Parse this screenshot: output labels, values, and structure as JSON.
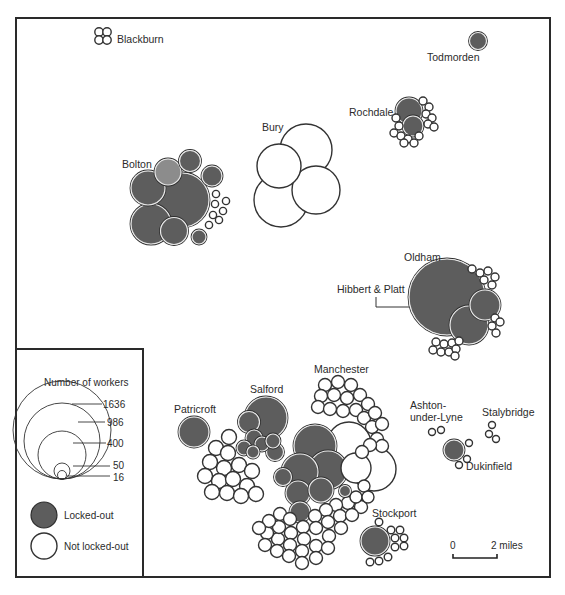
{
  "colors": {
    "locked_out": "#5d5d5d",
    "locked_out_light": "#8c8c8c",
    "not_locked_out": "#ffffff",
    "stroke": "#333333",
    "frame": "#2a2a2a"
  },
  "places": [
    {
      "name": "Blackburn",
      "label": "Blackburn",
      "x": 117,
      "y": 43
    },
    {
      "name": "Todmorden",
      "label": "Todmorden",
      "x": 427,
      "y": 61
    },
    {
      "name": "Rochdale",
      "label": "Rochdale",
      "x": 349,
      "y": 116
    },
    {
      "name": "Bury",
      "label": "Bury",
      "x": 262,
      "y": 131
    },
    {
      "name": "Bolton",
      "label": "Bolton",
      "x": 122,
      "y": 168
    },
    {
      "name": "Oldham",
      "label": "Oldham",
      "x": 404,
      "y": 261
    },
    {
      "name": "Hibbert & Platt",
      "label": "Hibbert & Platt",
      "x": 337,
      "y": 293
    },
    {
      "name": "Manchester",
      "label": "Manchester",
      "x": 314,
      "y": 373
    },
    {
      "name": "Salford",
      "label": "Salford",
      "x": 250,
      "y": 393
    },
    {
      "name": "Patricroft",
      "label": "Patricroft",
      "x": 174,
      "y": 413
    },
    {
      "name": "Ashton-",
      "label": "Ashton-",
      "x": 410,
      "y": 409
    },
    {
      "name": "under-Lyne",
      "label": "under-Lyne",
      "x": 410,
      "y": 421
    },
    {
      "name": "Stalybridge",
      "label": "Stalybridge",
      "x": 482,
      "y": 416
    },
    {
      "name": "Dukinfield",
      "label": "Dukinfield",
      "x": 466,
      "y": 470
    },
    {
      "name": "Stockport",
      "label": "Stockport",
      "x": 372,
      "y": 517
    }
  ],
  "legend": {
    "size_title": "Number of workers",
    "sizes": [
      {
        "label": "1636",
        "r": 30
      },
      {
        "label": "986",
        "r": 23
      },
      {
        "label": "400",
        "r": 15
      },
      {
        "label": "50",
        "r": 5.5
      },
      {
        "label": "16",
        "r": 3
      }
    ],
    "status": [
      {
        "label": "Locked-out",
        "type": "locked"
      },
      {
        "label": "Not locked-out",
        "type": "not"
      }
    ]
  },
  "scale_bar": {
    "start_label": "0",
    "end_label": "2 miles"
  },
  "circles": [
    {
      "g": "Blackburn",
      "x": 99,
      "y": 32,
      "r": 4.2,
      "t": "not"
    },
    {
      "g": "Blackburn",
      "x": 107,
      "y": 32,
      "r": 4.2,
      "t": "not"
    },
    {
      "g": "Blackburn",
      "x": 99,
      "y": 40,
      "r": 4.2,
      "t": "not"
    },
    {
      "g": "Blackburn",
      "x": 107,
      "y": 40,
      "r": 4.2,
      "t": "not"
    },
    {
      "g": "Todmorden",
      "x": 478,
      "y": 41,
      "r": 8.5,
      "t": "locked"
    },
    {
      "g": "Rochdale",
      "x": 409,
      "y": 111,
      "r": 13,
      "t": "locked"
    },
    {
      "g": "Rochdale",
      "x": 413,
      "y": 126,
      "r": 10,
      "t": "locked"
    },
    {
      "g": "Rochdale",
      "x": 423,
      "y": 101,
      "r": 4,
      "t": "not"
    },
    {
      "g": "Rochdale",
      "x": 429,
      "y": 107,
      "r": 4,
      "t": "not"
    },
    {
      "g": "Rochdale",
      "x": 426,
      "y": 114,
      "r": 4,
      "t": "not"
    },
    {
      "g": "Rochdale",
      "x": 432,
      "y": 118,
      "r": 4,
      "t": "not"
    },
    {
      "g": "Rochdale",
      "x": 428,
      "y": 124,
      "r": 4,
      "t": "not"
    },
    {
      "g": "Rochdale",
      "x": 434,
      "y": 127,
      "r": 4,
      "t": "not"
    },
    {
      "g": "Rochdale",
      "x": 396,
      "y": 118,
      "r": 4,
      "t": "not"
    },
    {
      "g": "Rochdale",
      "x": 399,
      "y": 126,
      "r": 4,
      "t": "not"
    },
    {
      "g": "Rochdale",
      "x": 394,
      "y": 133,
      "r": 4,
      "t": "not"
    },
    {
      "g": "Rochdale",
      "x": 401,
      "y": 136,
      "r": 4,
      "t": "not"
    },
    {
      "g": "Rochdale",
      "x": 408,
      "y": 139,
      "r": 4,
      "t": "not"
    },
    {
      "g": "Rochdale",
      "x": 414,
      "y": 143,
      "r": 4,
      "t": "not"
    },
    {
      "g": "Rochdale",
      "x": 419,
      "y": 136,
      "r": 4,
      "t": "not"
    },
    {
      "g": "Rochdale",
      "x": 404,
      "y": 143,
      "r": 4,
      "t": "not"
    },
    {
      "g": "Bury",
      "x": 279,
      "y": 166,
      "r": 22,
      "t": "not"
    },
    {
      "g": "Bury",
      "x": 306,
      "y": 150,
      "r": 26,
      "t": "not"
    },
    {
      "g": "Bury",
      "x": 316,
      "y": 190,
      "r": 24,
      "t": "not"
    },
    {
      "g": "Bury",
      "x": 281,
      "y": 200,
      "r": 27,
      "t": "not"
    },
    {
      "g": "Bolton",
      "x": 190,
      "y": 161,
      "r": 10.5,
      "t": "locked"
    },
    {
      "g": "Bolton",
      "x": 168,
      "y": 172,
      "r": 13,
      "t": "locked-light"
    },
    {
      "g": "Bolton",
      "x": 182,
      "y": 200,
      "r": 27,
      "t": "locked"
    },
    {
      "g": "Bolton",
      "x": 148,
      "y": 188,
      "r": 17,
      "t": "locked"
    },
    {
      "g": "Bolton",
      "x": 151,
      "y": 224,
      "r": 20,
      "t": "locked"
    },
    {
      "g": "Bolton",
      "x": 174,
      "y": 231,
      "r": 13.5,
      "t": "locked"
    },
    {
      "g": "Bolton",
      "x": 212,
      "y": 176,
      "r": 10,
      "t": "locked"
    },
    {
      "g": "Bolton",
      "x": 199,
      "y": 237,
      "r": 7,
      "t": "locked"
    },
    {
      "g": "Bolton",
      "x": 216,
      "y": 194,
      "r": 3.6,
      "t": "not"
    },
    {
      "g": "Bolton",
      "x": 226,
      "y": 201,
      "r": 3.6,
      "t": "not"
    },
    {
      "g": "Bolton",
      "x": 215,
      "y": 204,
      "r": 3.6,
      "t": "not"
    },
    {
      "g": "Bolton",
      "x": 223,
      "y": 211,
      "r": 3.6,
      "t": "not"
    },
    {
      "g": "Bolton",
      "x": 213,
      "y": 215,
      "r": 3.6,
      "t": "not"
    },
    {
      "g": "Bolton",
      "x": 219,
      "y": 220,
      "r": 3.6,
      "t": "not"
    },
    {
      "g": "Bolton",
      "x": 209,
      "y": 225,
      "r": 3.6,
      "t": "not"
    },
    {
      "g": "Oldham",
      "x": 447,
      "y": 297,
      "r": 38,
      "t": "locked"
    },
    {
      "g": "Oldham",
      "x": 485,
      "y": 305,
      "r": 15,
      "t": "locked"
    },
    {
      "g": "Oldham",
      "x": 469,
      "y": 325,
      "r": 19,
      "t": "locked"
    },
    {
      "g": "Oldham",
      "x": 472,
      "y": 269,
      "r": 4,
      "t": "not"
    },
    {
      "g": "Oldham",
      "x": 480,
      "y": 273,
      "r": 4,
      "t": "not"
    },
    {
      "g": "Oldham",
      "x": 488,
      "y": 271,
      "r": 4,
      "t": "not"
    },
    {
      "g": "Oldham",
      "x": 495,
      "y": 277,
      "r": 4,
      "t": "not"
    },
    {
      "g": "Oldham",
      "x": 484,
      "y": 280,
      "r": 4,
      "t": "not"
    },
    {
      "g": "Oldham",
      "x": 492,
      "y": 285,
      "r": 4,
      "t": "not"
    },
    {
      "g": "Oldham",
      "x": 495,
      "y": 318,
      "r": 4,
      "t": "not"
    },
    {
      "g": "Oldham",
      "x": 492,
      "y": 326,
      "r": 4,
      "t": "not"
    },
    {
      "g": "Oldham",
      "x": 500,
      "y": 322,
      "r": 4,
      "t": "not"
    },
    {
      "g": "Oldham",
      "x": 496,
      "y": 333,
      "r": 4,
      "t": "not"
    },
    {
      "g": "Oldham",
      "x": 436,
      "y": 342,
      "r": 4,
      "t": "not"
    },
    {
      "g": "Oldham",
      "x": 444,
      "y": 344,
      "r": 4,
      "t": "not"
    },
    {
      "g": "Oldham",
      "x": 452,
      "y": 343,
      "r": 4,
      "t": "not"
    },
    {
      "g": "Oldham",
      "x": 433,
      "y": 350,
      "r": 4,
      "t": "not"
    },
    {
      "g": "Oldham",
      "x": 441,
      "y": 352,
      "r": 4,
      "t": "not"
    },
    {
      "g": "Oldham",
      "x": 449,
      "y": 352,
      "r": 4,
      "t": "not"
    },
    {
      "g": "Oldham",
      "x": 456,
      "y": 349,
      "r": 4,
      "t": "not"
    },
    {
      "g": "Oldham",
      "x": 459,
      "y": 341,
      "r": 4,
      "t": "not"
    },
    {
      "g": "Oldham",
      "x": 455,
      "y": 356,
      "r": 4,
      "t": "not"
    },
    {
      "g": "Patricroft",
      "x": 194,
      "y": 432,
      "r": 15,
      "t": "locked"
    },
    {
      "g": "Salford",
      "x": 266,
      "y": 418,
      "r": 21,
      "t": "locked"
    },
    {
      "g": "Salford",
      "x": 249,
      "y": 422,
      "r": 10.5,
      "t": "locked"
    },
    {
      "g": "Salford",
      "x": 254,
      "y": 438,
      "r": 8,
      "t": "locked"
    },
    {
      "g": "Salford",
      "x": 244,
      "y": 448,
      "r": 7,
      "t": "locked"
    },
    {
      "g": "Salford",
      "x": 262,
      "y": 444,
      "r": 7,
      "t": "locked"
    },
    {
      "g": "Salford",
      "x": 273,
      "y": 441,
      "r": 7,
      "t": "locked"
    },
    {
      "g": "Salford",
      "x": 275,
      "y": 452,
      "r": 8.5,
      "t": "locked"
    },
    {
      "g": "Salford",
      "x": 253,
      "y": 452,
      "r": 6,
      "t": "locked"
    },
    {
      "g": "Salford",
      "x": 229,
      "y": 437,
      "r": 7.5,
      "t": "not"
    },
    {
      "g": "Salford",
      "x": 216,
      "y": 448,
      "r": 7.5,
      "t": "not"
    },
    {
      "g": "Salford",
      "x": 228,
      "y": 453,
      "r": 7.5,
      "t": "not"
    },
    {
      "g": "Salford",
      "x": 210,
      "y": 462,
      "r": 7.5,
      "t": "not"
    },
    {
      "g": "Salford",
      "x": 224,
      "y": 468,
      "r": 7.5,
      "t": "not"
    },
    {
      "g": "Salford",
      "x": 239,
      "y": 465,
      "r": 7.5,
      "t": "not"
    },
    {
      "g": "Salford",
      "x": 252,
      "y": 471,
      "r": 7.5,
      "t": "not"
    },
    {
      "g": "Salford",
      "x": 205,
      "y": 476,
      "r": 7.5,
      "t": "not"
    },
    {
      "g": "Salford",
      "x": 219,
      "y": 481,
      "r": 7.5,
      "t": "not"
    },
    {
      "g": "Salford",
      "x": 233,
      "y": 479,
      "r": 7.5,
      "t": "not"
    },
    {
      "g": "Salford",
      "x": 247,
      "y": 486,
      "r": 7.5,
      "t": "not"
    },
    {
      "g": "Salford",
      "x": 212,
      "y": 492,
      "r": 7.5,
      "t": "not"
    },
    {
      "g": "Salford",
      "x": 227,
      "y": 493,
      "r": 7.5,
      "t": "not"
    },
    {
      "g": "Salford",
      "x": 241,
      "y": 496,
      "r": 7.5,
      "t": "not"
    },
    {
      "g": "Salford",
      "x": 256,
      "y": 494,
      "r": 7.5,
      "t": "not"
    },
    {
      "g": "Manchester",
      "x": 349,
      "y": 444,
      "r": 22,
      "t": "not"
    },
    {
      "g": "Manchester",
      "x": 374,
      "y": 469,
      "r": 22,
      "t": "not"
    },
    {
      "g": "Manchester",
      "x": 356,
      "y": 468,
      "r": 15,
      "t": "not"
    },
    {
      "g": "Manchester",
      "x": 315,
      "y": 446,
      "r": 21,
      "t": "locked"
    },
    {
      "g": "Manchester",
      "x": 300,
      "y": 472,
      "r": 18,
      "t": "locked"
    },
    {
      "g": "Manchester",
      "x": 328,
      "y": 470,
      "r": 19,
      "t": "locked"
    },
    {
      "g": "Manchester",
      "x": 283,
      "y": 477,
      "r": 8.5,
      "t": "locked"
    },
    {
      "g": "Manchester",
      "x": 298,
      "y": 493,
      "r": 12,
      "t": "locked"
    },
    {
      "g": "Manchester",
      "x": 321,
      "y": 490,
      "r": 12,
      "t": "locked"
    },
    {
      "g": "Manchester",
      "x": 300,
      "y": 512,
      "r": 10,
      "t": "locked"
    },
    {
      "g": "Manchester",
      "x": 345,
      "y": 491,
      "r": 5.5,
      "t": "locked"
    },
    {
      "g": "Manchester",
      "x": 325,
      "y": 385,
      "r": 6.5,
      "t": "not"
    },
    {
      "g": "Manchester",
      "x": 338,
      "y": 382,
      "r": 6.5,
      "t": "not"
    },
    {
      "g": "Manchester",
      "x": 351,
      "y": 385,
      "r": 6.5,
      "t": "not"
    },
    {
      "g": "Manchester",
      "x": 321,
      "y": 396,
      "r": 6.5,
      "t": "not"
    },
    {
      "g": "Manchester",
      "x": 334,
      "y": 395,
      "r": 6.5,
      "t": "not"
    },
    {
      "g": "Manchester",
      "x": 347,
      "y": 398,
      "r": 6.5,
      "t": "not"
    },
    {
      "g": "Manchester",
      "x": 360,
      "y": 395,
      "r": 6.5,
      "t": "not"
    },
    {
      "g": "Manchester",
      "x": 318,
      "y": 407,
      "r": 6.5,
      "t": "not"
    },
    {
      "g": "Manchester",
      "x": 330,
      "y": 409,
      "r": 6.5,
      "t": "not"
    },
    {
      "g": "Manchester",
      "x": 343,
      "y": 411,
      "r": 6.5,
      "t": "not"
    },
    {
      "g": "Manchester",
      "x": 356,
      "y": 410,
      "r": 6.5,
      "t": "not"
    },
    {
      "g": "Manchester",
      "x": 368,
      "y": 404,
      "r": 6.5,
      "t": "not"
    },
    {
      "g": "Manchester",
      "x": 364,
      "y": 418,
      "r": 6.5,
      "t": "not"
    },
    {
      "g": "Manchester",
      "x": 375,
      "y": 413,
      "r": 6.5,
      "t": "not"
    },
    {
      "g": "Manchester",
      "x": 372,
      "y": 427,
      "r": 6.5,
      "t": "not"
    },
    {
      "g": "Manchester",
      "x": 382,
      "y": 424,
      "r": 6.5,
      "t": "not"
    },
    {
      "g": "Manchester",
      "x": 377,
      "y": 439,
      "r": 6.5,
      "t": "not"
    },
    {
      "g": "Manchester",
      "x": 382,
      "y": 446,
      "r": 6.5,
      "t": "not"
    },
    {
      "g": "Manchester",
      "x": 370,
      "y": 445,
      "r": 6.5,
      "t": "not"
    },
    {
      "g": "Manchester",
      "x": 362,
      "y": 452,
      "r": 6.5,
      "t": "not"
    },
    {
      "g": "Manchester",
      "x": 356,
      "y": 497,
      "r": 6,
      "t": "not"
    },
    {
      "g": "Manchester",
      "x": 364,
      "y": 486,
      "r": 6,
      "t": "not"
    },
    {
      "g": "Manchester",
      "x": 368,
      "y": 497,
      "r": 6,
      "t": "not"
    },
    {
      "g": "Manchester",
      "x": 348,
      "y": 503,
      "r": 6.5,
      "t": "not"
    },
    {
      "g": "Manchester",
      "x": 361,
      "y": 507,
      "r": 6.5,
      "t": "not"
    },
    {
      "g": "Manchester",
      "x": 336,
      "y": 505,
      "r": 6.5,
      "t": "not"
    },
    {
      "g": "Manchester",
      "x": 340,
      "y": 516,
      "r": 6.5,
      "t": "not"
    },
    {
      "g": "Manchester",
      "x": 326,
      "y": 510,
      "r": 6.5,
      "t": "not"
    },
    {
      "g": "Manchester",
      "x": 352,
      "y": 515,
      "r": 6.5,
      "t": "not"
    },
    {
      "g": "Manchester",
      "x": 315,
      "y": 516,
      "r": 6.5,
      "t": "not"
    },
    {
      "g": "Manchester",
      "x": 328,
      "y": 522,
      "r": 6.5,
      "t": "not"
    },
    {
      "g": "Manchester",
      "x": 316,
      "y": 528,
      "r": 6.5,
      "t": "not"
    },
    {
      "g": "Manchester",
      "x": 303,
      "y": 527,
      "r": 6.5,
      "t": "not"
    },
    {
      "g": "Manchester",
      "x": 304,
      "y": 539,
      "r": 6.5,
      "t": "not"
    },
    {
      "g": "Manchester",
      "x": 291,
      "y": 533,
      "r": 6.5,
      "t": "not"
    },
    {
      "g": "Manchester",
      "x": 290,
      "y": 545,
      "r": 6.5,
      "t": "not"
    },
    {
      "g": "Manchester",
      "x": 278,
      "y": 539,
      "r": 6.5,
      "t": "not"
    },
    {
      "g": "Manchester",
      "x": 279,
      "y": 527,
      "r": 6.5,
      "t": "not"
    },
    {
      "g": "Manchester",
      "x": 267,
      "y": 533,
      "r": 6.5,
      "t": "not"
    },
    {
      "g": "Manchester",
      "x": 265,
      "y": 545,
      "r": 6.5,
      "t": "not"
    },
    {
      "g": "Manchester",
      "x": 277,
      "y": 551,
      "r": 6.5,
      "t": "not"
    },
    {
      "g": "Manchester",
      "x": 289,
      "y": 556,
      "r": 6.5,
      "t": "not"
    },
    {
      "g": "Manchester",
      "x": 302,
      "y": 551,
      "r": 6.5,
      "t": "not"
    },
    {
      "g": "Manchester",
      "x": 316,
      "y": 546,
      "r": 6.5,
      "t": "not"
    },
    {
      "g": "Manchester",
      "x": 329,
      "y": 536,
      "r": 6.5,
      "t": "not"
    },
    {
      "g": "Manchester",
      "x": 341,
      "y": 528,
      "r": 6.5,
      "t": "not"
    },
    {
      "g": "Manchester",
      "x": 328,
      "y": 548,
      "r": 6.5,
      "t": "not"
    },
    {
      "g": "Manchester",
      "x": 269,
      "y": 521,
      "r": 6.5,
      "t": "not"
    },
    {
      "g": "Manchester",
      "x": 280,
      "y": 514,
      "r": 6.5,
      "t": "not"
    },
    {
      "g": "Manchester",
      "x": 290,
      "y": 519,
      "r": 6.5,
      "t": "not"
    },
    {
      "g": "Manchester",
      "x": 259,
      "y": 528,
      "r": 6.5,
      "t": "not"
    },
    {
      "g": "Manchester",
      "x": 316,
      "y": 558,
      "r": 6.5,
      "t": "not"
    },
    {
      "g": "Manchester",
      "x": 302,
      "y": 563,
      "r": 6.5,
      "t": "not"
    },
    {
      "g": "Stockport",
      "x": 375,
      "y": 541,
      "r": 14,
      "t": "locked"
    },
    {
      "g": "Stockport",
      "x": 379,
      "y": 522,
      "r": 3.8,
      "t": "not"
    },
    {
      "g": "Stockport",
      "x": 391,
      "y": 530,
      "r": 3.8,
      "t": "not"
    },
    {
      "g": "Stockport",
      "x": 400,
      "y": 530,
      "r": 3.8,
      "t": "not"
    },
    {
      "g": "Stockport",
      "x": 395,
      "y": 538,
      "r": 3.8,
      "t": "not"
    },
    {
      "g": "Stockport",
      "x": 404,
      "y": 538,
      "r": 3.8,
      "t": "not"
    },
    {
      "g": "Stockport",
      "x": 395,
      "y": 547,
      "r": 3.8,
      "t": "not"
    },
    {
      "g": "Stockport",
      "x": 404,
      "y": 546,
      "r": 3.8,
      "t": "not"
    },
    {
      "g": "Stockport",
      "x": 388,
      "y": 557,
      "r": 3.8,
      "t": "not"
    },
    {
      "g": "Stockport",
      "x": 379,
      "y": 561,
      "r": 3.8,
      "t": "not"
    },
    {
      "g": "Stockport",
      "x": 370,
      "y": 562,
      "r": 3.8,
      "t": "not"
    },
    {
      "g": "Ashton-under-Lyne",
      "x": 432,
      "y": 432,
      "r": 3.5,
      "t": "not"
    },
    {
      "g": "Ashton-under-Lyne",
      "x": 441,
      "y": 430,
      "r": 3.5,
      "t": "not"
    },
    {
      "g": "Dukinfield",
      "x": 454,
      "y": 450,
      "r": 10,
      "t": "locked"
    },
    {
      "g": "Dukinfield",
      "x": 469,
      "y": 443,
      "r": 3.5,
      "t": "not"
    },
    {
      "g": "Dukinfield",
      "x": 467,
      "y": 459,
      "r": 3.5,
      "t": "not"
    },
    {
      "g": "Dukinfield",
      "x": 459,
      "y": 465,
      "r": 3.5,
      "t": "not"
    },
    {
      "g": "Stalybridge",
      "x": 492,
      "y": 425,
      "r": 3.5,
      "t": "not"
    },
    {
      "g": "Stalybridge",
      "x": 489,
      "y": 434,
      "r": 3.5,
      "t": "not"
    },
    {
      "g": "Stalybridge",
      "x": 496,
      "y": 439,
      "r": 3.5,
      "t": "not"
    }
  ]
}
